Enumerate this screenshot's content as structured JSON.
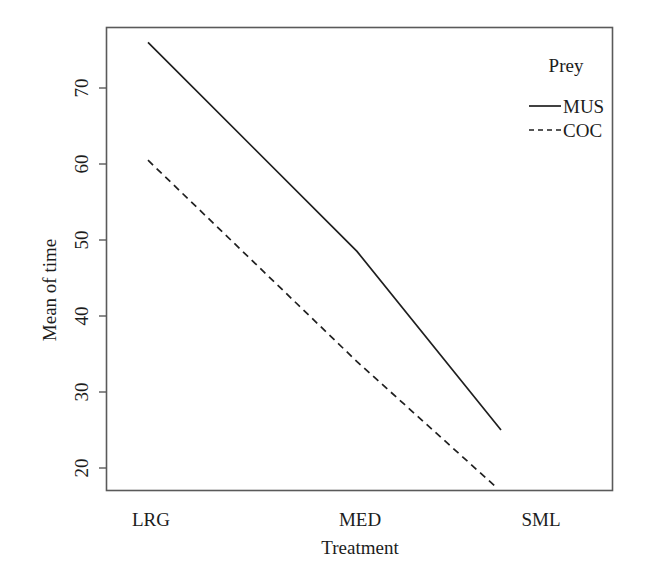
{
  "chart_data": {
    "type": "line",
    "title": "",
    "subtitle": "",
    "xlabel": "Treatment",
    "ylabel": "Mean of time",
    "categories": [
      "LRG",
      "MED",
      "SML"
    ],
    "series": [
      {
        "name": "MUS",
        "style": "solid",
        "values": [
          76,
          48.5,
          25
        ]
      },
      {
        "name": "COC",
        "style": "dashed",
        "values": [
          60.5,
          34,
          17.5
        ]
      }
    ],
    "yticks": [
      20,
      30,
      40,
      50,
      60,
      70
    ],
    "ytick_labels": [
      "20",
      "30",
      "40",
      "50",
      "60",
      "70"
    ],
    "ylim": [
      16,
      77.5
    ],
    "xlim": [
      0,
      1
    ],
    "grid": false,
    "legend": {
      "title": "Prey",
      "position": "top-right",
      "entries": [
        "MUS",
        "COC"
      ]
    },
    "line_color": "#1f1f1f",
    "frame_color": "#5a5a5a"
  },
  "axes": {
    "y_label": "Mean of time",
    "x_label": "Treatment",
    "y_tick_0": "20",
    "y_tick_1": "30",
    "y_tick_2": "40",
    "y_tick_3": "50",
    "y_tick_4": "60",
    "y_tick_5": "70",
    "x_tick_0": "LRG",
    "x_tick_1": "MED",
    "x_tick_2": "SML"
  },
  "legend": {
    "title": "Prey",
    "entry_0": "MUS",
    "entry_1": "COC"
  }
}
